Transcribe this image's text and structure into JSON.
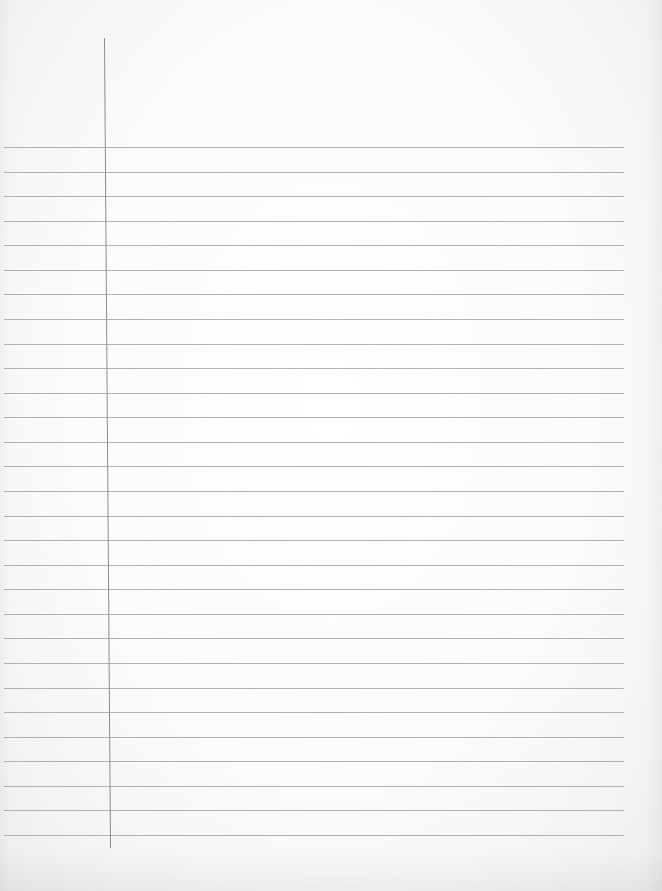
{
  "document": {
    "type": "lined-notebook-paper",
    "text_content": "",
    "background_color": "#fafafa",
    "rule_color": "#a4a4a4",
    "margin_color": "#8c8c8c"
  },
  "rules": {
    "count": 29,
    "first_y": 147,
    "spacing": 24.57,
    "x_start": 4,
    "x_end": 624
  },
  "margin": {
    "x_top": 104,
    "x_bottom": 110,
    "y_top": 38,
    "y_bottom": 848
  }
}
